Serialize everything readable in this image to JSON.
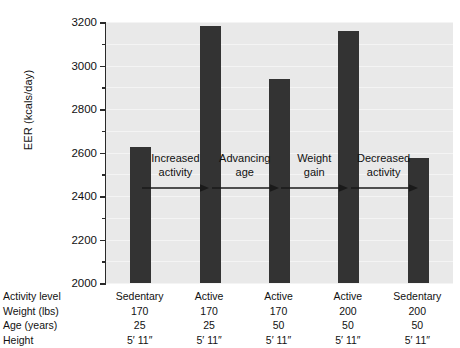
{
  "chart_data": {
    "type": "bar",
    "title": "",
    "xlabel": "",
    "ylabel": "EER (kcals/day)",
    "ylim": [
      2000,
      3200
    ],
    "ytick_major_step": 200,
    "ytick_minor_step": 100,
    "yticks": [
      2000,
      2200,
      2400,
      2600,
      2800,
      3000,
      3200
    ],
    "ytick_labels": [
      "2000",
      "2200",
      "2400",
      "2600",
      "2800",
      "3000",
      "3200"
    ],
    "grid": true,
    "legend": "none",
    "bar_color": "#333333",
    "plot_background": "#e9e9e9",
    "categories": [
      "1",
      "2",
      "3",
      "4",
      "5"
    ],
    "values": [
      2625,
      3180,
      2940,
      3160,
      2575
    ],
    "annotations": [
      {
        "line1": "Increased",
        "line2": "activity",
        "arrow": "right-arrow"
      },
      {
        "line1": "Advancing",
        "line2": "age",
        "arrow": "right-arrow"
      },
      {
        "line1": "Weight",
        "line2": "gain",
        "arrow": "right-arrow"
      },
      {
        "line1": "Decreased",
        "line2": "activity",
        "arrow": "right-arrow"
      }
    ]
  },
  "data_table": {
    "row_labels": [
      "Activity level",
      "Weight (lbs)",
      "Age (years)",
      "Height"
    ],
    "columns": [
      {
        "activity_level": "Sedentary",
        "weight": "170",
        "age": "25",
        "height": "5′ 11″"
      },
      {
        "activity_level": "Active",
        "weight": "170",
        "age": "25",
        "height": "5′ 11″"
      },
      {
        "activity_level": "Active",
        "weight": "170",
        "age": "50",
        "height": "5′ 11″"
      },
      {
        "activity_level": "Active",
        "weight": "200",
        "age": "50",
        "height": "5′ 11″"
      },
      {
        "activity_level": "Sedentary",
        "weight": "200",
        "age": "50",
        "height": "5′ 11″"
      }
    ]
  }
}
